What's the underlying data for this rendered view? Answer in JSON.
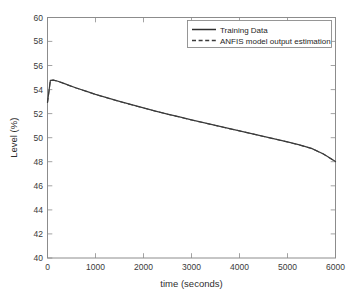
{
  "chart_data": {
    "type": "line",
    "title": "",
    "xlabel": "time (seconds)",
    "ylabel": "Level (%)",
    "xlim": [
      0,
      6000
    ],
    "ylim": [
      40,
      60
    ],
    "xticks": [
      0,
      1000,
      2000,
      3000,
      4000,
      5000,
      6000
    ],
    "yticks": [
      40,
      42,
      44,
      46,
      48,
      50,
      52,
      54,
      56,
      58,
      60
    ],
    "xtick_labels": [
      "0",
      "1000",
      "2000",
      "3000",
      "4000",
      "5000",
      "6000"
    ],
    "ytick_labels": [
      "40",
      "42",
      "44",
      "46",
      "48",
      "50",
      "52",
      "54",
      "56",
      "58",
      "60"
    ],
    "grid": false,
    "legend_position": "top-right-inside",
    "legend": [
      "Training Data",
      "ANFIS model output estimation"
    ],
    "x": [
      0,
      60,
      120,
      200,
      300,
      450,
      600,
      800,
      1000,
      1250,
      1500,
      1750,
      2000,
      2250,
      2500,
      2750,
      3000,
      3250,
      3500,
      3750,
      4000,
      4250,
      4500,
      4750,
      5000,
      5250,
      5500,
      5750,
      6000
    ],
    "series": [
      {
        "name": "Training Data",
        "style": "solid",
        "color": "#3b3b3b",
        "values": [
          52.95,
          54.78,
          54.8,
          54.72,
          54.58,
          54.36,
          54.14,
          53.87,
          53.61,
          53.31,
          53.02,
          52.75,
          52.48,
          52.22,
          51.97,
          51.73,
          51.49,
          51.26,
          51.03,
          50.8,
          50.58,
          50.35,
          50.12,
          49.89,
          49.65,
          49.4,
          49.12,
          48.65,
          48.02
        ]
      },
      {
        "name": "ANFIS model output estimation",
        "style": "dashed",
        "color": "#4a4a4a",
        "values": [
          52.9,
          54.76,
          54.79,
          54.71,
          54.57,
          54.35,
          54.13,
          53.86,
          53.6,
          53.3,
          53.01,
          52.74,
          52.47,
          52.21,
          51.96,
          51.72,
          51.48,
          51.25,
          51.02,
          50.79,
          50.57,
          50.34,
          50.11,
          49.88,
          49.64,
          49.39,
          49.11,
          48.64,
          48.01
        ]
      }
    ]
  },
  "axes": {
    "x_label": "time (seconds)",
    "y_label": "Level (%)"
  },
  "legend": {
    "entries": [
      {
        "label": "Training Data",
        "style": "solid"
      },
      {
        "label": "ANFIS model output estimation",
        "style": "dashed"
      }
    ]
  },
  "colors": {
    "background": "#ffffff",
    "axis": "#8c8c8c",
    "series_solid": "#3b3b3b",
    "series_dashed": "#4a4a4a",
    "text": "#2e2e2e"
  }
}
